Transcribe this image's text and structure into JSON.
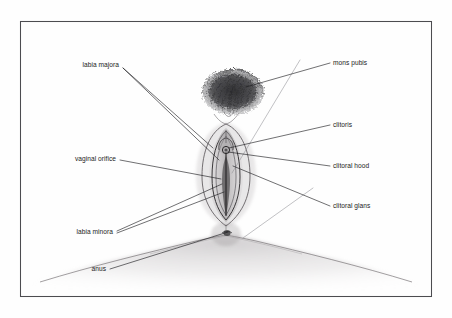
{
  "figure": {
    "style": "pencil sketch line drawing with leader-line labels",
    "frame": {
      "x": 20,
      "y": 21,
      "width": 411,
      "height": 275,
      "stroke_color": "#4c4c50"
    },
    "background_color": "#fefefe",
    "ink_color": "#16161a"
  },
  "labels": {
    "left": [
      {
        "id": "labia-majora",
        "text": "labia majora",
        "text_x": 119,
        "text_y": 67,
        "leaders": [
          {
            "x1": 123,
            "y1": 68,
            "x2": 213,
            "y2": 148
          },
          {
            "x1": 123,
            "y1": 68,
            "x2": 219,
            "y2": 160
          }
        ]
      },
      {
        "id": "vaginal-orifice",
        "text": "vaginal orifice",
        "text_x": 116,
        "text_y": 161,
        "leaders": [
          {
            "x1": 120,
            "y1": 160,
            "x2": 221,
            "y2": 179
          }
        ]
      },
      {
        "id": "labia-minora",
        "text": "labia minora",
        "text_x": 113,
        "text_y": 234,
        "leaders": [
          {
            "x1": 117,
            "y1": 231,
            "x2": 222,
            "y2": 184
          },
          {
            "x1": 117,
            "y1": 233,
            "x2": 224,
            "y2": 192
          }
        ]
      },
      {
        "id": "anus",
        "text": "anus",
        "text_x": 106,
        "text_y": 271,
        "leaders": [
          {
            "x1": 110,
            "y1": 269,
            "x2": 228,
            "y2": 232
          }
        ]
      }
    ],
    "right": [
      {
        "id": "mons-pubis",
        "text": "mons pubis",
        "text_x": 333,
        "text_y": 65,
        "leaders": [
          {
            "x1": 330,
            "y1": 63,
            "x2": 246,
            "y2": 87
          }
        ]
      },
      {
        "id": "clitoris",
        "text": "clitoris",
        "text_x": 333,
        "text_y": 127,
        "leaders": [
          {
            "x1": 330,
            "y1": 125,
            "x2": 229,
            "y2": 148
          }
        ]
      },
      {
        "id": "clitoral-hood",
        "text": "clitoral hood",
        "text_x": 333,
        "text_y": 168,
        "leaders": [
          {
            "x1": 330,
            "y1": 166,
            "x2": 228,
            "y2": 152
          }
        ]
      },
      {
        "id": "clitoral-glans",
        "text": "clitoral glans",
        "text_x": 333,
        "text_y": 208,
        "leaders": [
          {
            "x1": 330,
            "y1": 206,
            "x2": 233,
            "y2": 166
          }
        ]
      }
    ]
  },
  "faint_leaders": [
    {
      "x1": 300,
      "y1": 60,
      "x2": 232,
      "y2": 173
    },
    {
      "x1": 313,
      "y1": 188,
      "x2": 243,
      "y2": 238
    }
  ],
  "drawing": {
    "pubic_hair": {
      "name": "mons pubis pubic hair mass",
      "center_x": 233,
      "center_y": 92,
      "radius_x": 31,
      "radius_y": 23,
      "tone": "dark dense scribble"
    },
    "vulva_cleft": {
      "name": "vulval cleft and labia",
      "center_x": 222,
      "center_y": 175,
      "half_width": 15,
      "top_y": 127,
      "bottom_y": 224
    },
    "thighs": {
      "name": "inner thigh shading",
      "left_x": 30,
      "right_x": 420,
      "crease_y": 240
    }
  }
}
